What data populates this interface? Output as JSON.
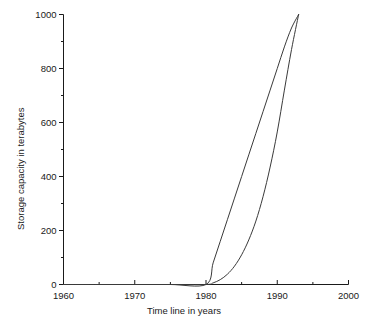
{
  "chart_data": {
    "type": "line",
    "title": "",
    "xlabel": "Time line in years",
    "ylabel": "Storage capacity in terabytes",
    "xlim": [
      1960,
      2000
    ],
    "ylim": [
      0,
      1000
    ],
    "grid": false,
    "legend": "none",
    "background_color": "#ffffff",
    "line_color": "#3a3a3a",
    "axis_color": "#1a1a1a",
    "x_ticks_major": [
      1960,
      1970,
      1980,
      1990,
      2000
    ],
    "x_tick_labels": [
      "1960",
      "1970",
      "1980",
      "1990",
      "2000"
    ],
    "x_ticks_minor": [
      1965,
      1975,
      1985,
      1995
    ],
    "y_ticks_major": [
      0,
      200,
      400,
      600,
      800,
      1000
    ],
    "y_tick_labels": [
      "0",
      "200",
      "400",
      "600",
      "800",
      "1000"
    ],
    "y_ticks_minor": [
      100,
      300,
      500,
      700,
      900
    ],
    "series": [
      {
        "name": "upper-bound-curve",
        "points": [
          [
            1960,
            0
          ],
          [
            1965,
            0
          ],
          [
            1970,
            0
          ],
          [
            1975,
            0
          ],
          [
            1980,
            0
          ],
          [
            1981,
            80
          ],
          [
            1982,
            160
          ],
          [
            1983,
            240
          ],
          [
            1984,
            320
          ],
          [
            1985,
            400
          ],
          [
            1986,
            480
          ],
          [
            1987,
            560
          ],
          [
            1988,
            640
          ],
          [
            1989,
            720
          ],
          [
            1990,
            800
          ],
          [
            1991,
            880
          ],
          [
            1992,
            950
          ],
          [
            1993,
            1000
          ]
        ]
      },
      {
        "name": "lower-bound-curve",
        "points": [
          [
            1960,
            0
          ],
          [
            1965,
            0
          ],
          [
            1970,
            0
          ],
          [
            1975,
            0
          ],
          [
            1980,
            0
          ],
          [
            1981,
            6
          ],
          [
            1982,
            18
          ],
          [
            1983,
            38
          ],
          [
            1984,
            68
          ],
          [
            1985,
            110
          ],
          [
            1986,
            165
          ],
          [
            1987,
            235
          ],
          [
            1988,
            325
          ],
          [
            1989,
            435
          ],
          [
            1990,
            565
          ],
          [
            1991,
            720
          ],
          [
            1992,
            870
          ],
          [
            1993,
            1000
          ]
        ]
      }
    ]
  }
}
